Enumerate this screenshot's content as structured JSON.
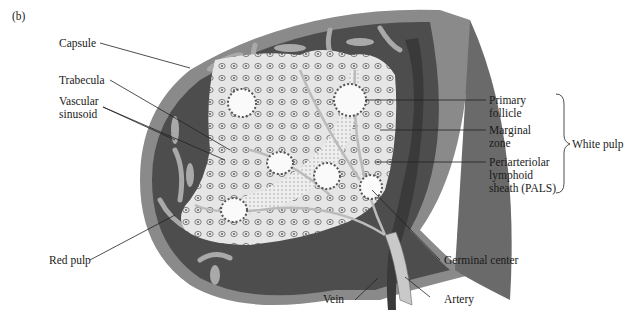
{
  "figure": {
    "panel_label": "(b)"
  },
  "labels": {
    "capsule": "Capsule",
    "trabecula": "Trabecula",
    "vascular_sinusoid_line1": "Vascular",
    "vascular_sinusoid_line2": "sinusoid",
    "red_pulp": "Red pulp",
    "primary_follicle_line1": "Primary",
    "primary_follicle_line2": "follicle",
    "marginal_zone_line1": "Marginal",
    "marginal_zone_line2": "zone",
    "pals_line1": "Periarteriolar",
    "pals_line2": "lymphoid",
    "pals_line3": "sheath (PALS)",
    "white_pulp": "White pulp",
    "germinal_center": "Germinal center",
    "vein": "Vein",
    "artery": "Artery"
  },
  "colors": {
    "capsule": "#8a8a8a",
    "red_pulp": "#4a4a4a",
    "white_pulp": "#e9e9e9",
    "trabecula": "#a9a9a9",
    "vein": "#3a3a3a",
    "artery": "#c9c9c9"
  }
}
